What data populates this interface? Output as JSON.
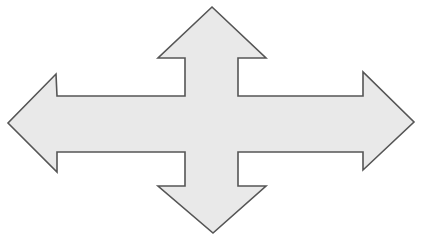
{
  "graphic": {
    "name": "four-way-arrow",
    "title": "Four-way directional arrow",
    "description": "A single gray cross-shaped arrow with four arrowheads pointing up, right, down and left",
    "canvas": {
      "width": 423,
      "height": 240,
      "background": "#ffffff"
    },
    "fill_color": "#e9e9e9",
    "stroke_color": "#555555",
    "stroke_width": 1.6,
    "directions": [
      "up",
      "right",
      "down",
      "left"
    ],
    "points": "212,7 266,58 238,58 238,96 363,96 363,72 414,122 363,170 363,152 238,152 238,186 266,186 213,233 158,186 185,186 185,152 57,152 57,172 8,123 56,74 57,96 185,96 185,58 158,58",
    "vertices": [
      {
        "label": "up-tip",
        "x": 212,
        "y": 7
      },
      {
        "label": "up-head-right",
        "x": 266,
        "y": 58
      },
      {
        "label": "up-shaft-right-top",
        "x": 238,
        "y": 58
      },
      {
        "label": "up-shaft-right-notch",
        "x": 238,
        "y": 96
      },
      {
        "label": "right-shaft-top",
        "x": 363,
        "y": 96
      },
      {
        "label": "right-head-top",
        "x": 363,
        "y": 72
      },
      {
        "label": "right-tip",
        "x": 414,
        "y": 122
      },
      {
        "label": "right-head-bottom",
        "x": 363,
        "y": 170
      },
      {
        "label": "right-shaft-bottom",
        "x": 363,
        "y": 152
      },
      {
        "label": "down-shaft-right-notch",
        "x": 238,
        "y": 152
      },
      {
        "label": "down-shaft-right-bottom",
        "x": 238,
        "y": 186
      },
      {
        "label": "down-head-right",
        "x": 266,
        "y": 186
      },
      {
        "label": "down-tip",
        "x": 213,
        "y": 233
      },
      {
        "label": "down-head-left",
        "x": 158,
        "y": 186
      },
      {
        "label": "down-shaft-left-bottom",
        "x": 185,
        "y": 186
      },
      {
        "label": "down-shaft-left-notch",
        "x": 185,
        "y": 152
      },
      {
        "label": "left-shaft-bottom",
        "x": 57,
        "y": 152
      },
      {
        "label": "left-head-bottom",
        "x": 57,
        "y": 172
      },
      {
        "label": "left-tip",
        "x": 8,
        "y": 123
      },
      {
        "label": "left-head-top",
        "x": 56,
        "y": 74
      },
      {
        "label": "left-shaft-top",
        "x": 57,
        "y": 96
      },
      {
        "label": "up-shaft-left-notch",
        "x": 185,
        "y": 96
      },
      {
        "label": "up-shaft-left-top",
        "x": 185,
        "y": 58
      },
      {
        "label": "up-head-left",
        "x": 158,
        "y": 58
      }
    ]
  }
}
